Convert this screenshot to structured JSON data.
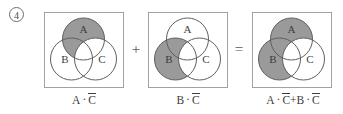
{
  "item": {
    "number": "4"
  },
  "colors": {
    "shade": "#9a9a9a",
    "circle_stroke": "#5f5f5f",
    "panel_border": "#a2a2a2",
    "text": "#3d3d3d",
    "background": "#ffffff"
  },
  "diagrams": [
    {
      "id": "diagram-a-not-c",
      "set_labels": {
        "a": "A",
        "b": "B",
        "c": "C"
      },
      "shaded_description": "A minus C",
      "caption": {
        "text": "A · C̅",
        "parts": [
          {
            "type": "plain",
            "value": "A"
          },
          {
            "type": "dot",
            "value": "·"
          },
          {
            "type": "overbar",
            "value": "C"
          }
        ]
      }
    },
    {
      "id": "diagram-b-not-c",
      "set_labels": {
        "a": "A",
        "b": "B",
        "c": "C"
      },
      "shaded_description": "B minus C",
      "caption": {
        "text": "B · C̅",
        "parts": [
          {
            "type": "plain",
            "value": "B"
          },
          {
            "type": "dot",
            "value": "·"
          },
          {
            "type": "overbar",
            "value": "C"
          }
        ]
      }
    },
    {
      "id": "diagram-a-not-c-plus-b-not-c",
      "set_labels": {
        "a": "A",
        "b": "B",
        "c": "C"
      },
      "shaded_description": "A minus C union B minus C",
      "caption": {
        "text": "A · C̅ + B · C̅",
        "parts": [
          {
            "type": "plain",
            "value": "A"
          },
          {
            "type": "dot",
            "value": "·"
          },
          {
            "type": "overbar",
            "value": "C"
          },
          {
            "type": "plus",
            "value": "+"
          },
          {
            "type": "plain",
            "value": "B"
          },
          {
            "type": "dot",
            "value": "·"
          },
          {
            "type": "overbar",
            "value": "C"
          }
        ]
      }
    }
  ],
  "operators": [
    {
      "id": "operator-plus",
      "symbol": "+"
    },
    {
      "id": "operator-equals",
      "symbol": "="
    }
  ]
}
